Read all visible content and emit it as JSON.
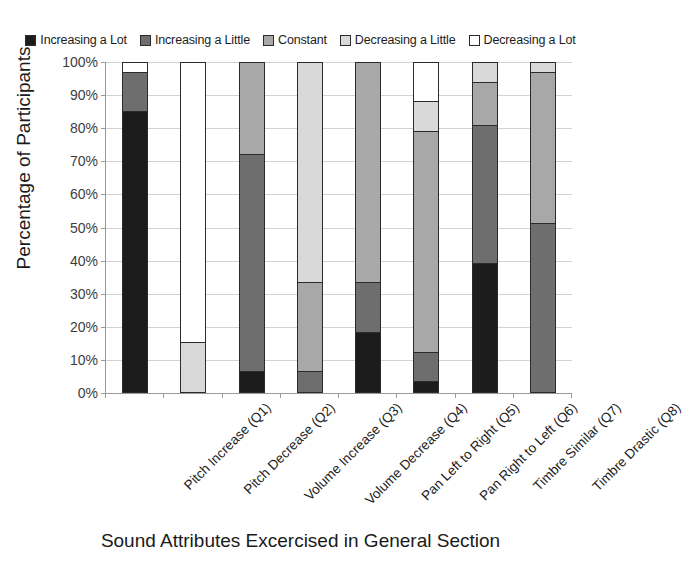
{
  "chart_data": {
    "type": "bar",
    "subtype": "stacked-bar-100-percent",
    "title": "",
    "xlabel": "Sound Attributes Excercised in General Section",
    "ylabel": "Percentage of Participants",
    "ylim": [
      0,
      100
    ],
    "ytick_labels": [
      "0%",
      "10%",
      "20%",
      "30%",
      "40%",
      "50%",
      "60%",
      "70%",
      "80%",
      "90%",
      "100%"
    ],
    "ytick_values": [
      0,
      10,
      20,
      30,
      40,
      50,
      60,
      70,
      80,
      90,
      100
    ],
    "grid": true,
    "legend_position": "top",
    "categories": [
      "Pitch Increase (Q1)",
      "Pitch Decrease (Q2)",
      "Volume Increase (Q3)",
      "Volume Decrease (Q4)",
      "Pan Left to Right (Q5)",
      "Pan Right to Left (Q6)",
      "Timbre Similar (Q7)",
      "Timbre Drastic (Q8)"
    ],
    "series": [
      {
        "name": "Increasing a Lot",
        "color": "#1c1c1c",
        "values": [
          85,
          0,
          6,
          0,
          18,
          3,
          39,
          0
        ]
      },
      {
        "name": "Increasing a Little",
        "color": "#6e6e6e",
        "values": [
          12,
          0,
          66,
          6,
          15,
          9,
          42,
          51
        ]
      },
      {
        "name": "Constant",
        "color": "#a8a8a8",
        "values": [
          0,
          0,
          28,
          27,
          67,
          67,
          13,
          46
        ]
      },
      {
        "name": "Decreasing a Little",
        "color": "#d9d9d9",
        "values": [
          0,
          15,
          0,
          67,
          0,
          9,
          6,
          3
        ]
      },
      {
        "name": "Decreasing a Lot",
        "color": "#ffffff",
        "values": [
          3,
          85,
          0,
          0,
          0,
          12,
          0,
          0
        ]
      }
    ]
  },
  "legend": {
    "items": [
      {
        "label": "Increasing a Lot",
        "color": "#1c1c1c"
      },
      {
        "label": "Increasing a Little",
        "color": "#6e6e6e"
      },
      {
        "label": "Constant",
        "color": "#a8a8a8"
      },
      {
        "label": "Decreasing a Little",
        "color": "#d9d9d9"
      },
      {
        "label": "Decreasing a Lot",
        "color": "#ffffff"
      }
    ]
  },
  "axes": {
    "y_title": "Percentage of Participants",
    "x_title": "Sound Attributes Excercised in General Section"
  }
}
